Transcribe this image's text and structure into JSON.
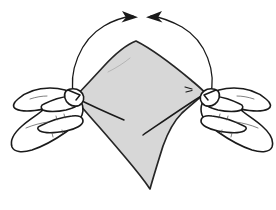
{
  "figure": {
    "background_color": "#ffffff",
    "line_color": "#1a1a1a",
    "width": 276,
    "height": 210
  },
  "cloth": {
    "label": "cloth",
    "shape": "diamond",
    "fill_color": "#d7d7d7",
    "outline_color": "#262626",
    "top_point": "apex",
    "bottom_point": "lower tip",
    "fold_lines": 2,
    "detail_marks": 2
  },
  "hands": [
    {
      "label": "left-hand",
      "side": "left",
      "grip": "pinching the left corner of the cloth",
      "fill_color": "#ffffff"
    },
    {
      "label": "right-hand",
      "side": "right",
      "grip": "pinching the right corner of the cloth",
      "fill_color": "#ffffff"
    }
  ],
  "motion_arrows": [
    {
      "label": "left-motion-arrow",
      "direction": "upward and inward to the right",
      "style": "curved arc with arrowhead",
      "color": "#1a1a1a"
    },
    {
      "label": "right-motion-arrow",
      "direction": "upward and inward to the left",
      "style": "curved arc with arrowhead",
      "color": "#1a1a1a"
    }
  ],
  "accessibility": {
    "description": "Line drawing: two hands grip the left and right corners of a gray diamond-shaped cloth. Two curved arrows sweep upward from each hand and meet above the cloth, showing that the corners are brought together."
  }
}
